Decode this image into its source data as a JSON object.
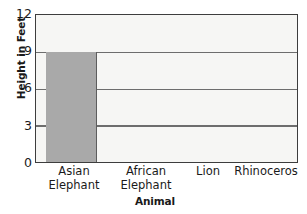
{
  "chart_data": {
    "type": "bar",
    "title": "",
    "xlabel": "Animal",
    "ylabel": "Height in Feet",
    "categories": [
      "Asian\nElephant",
      "African\nElephant",
      "Lion",
      "Rhinoceros"
    ],
    "values": [
      9,
      null,
      null,
      null
    ],
    "ylim": [
      0,
      12
    ],
    "yticks": [
      0,
      3,
      6,
      9,
      12
    ],
    "ytick_labels": [
      "0",
      "3",
      "6",
      "9",
      "12"
    ],
    "grid": "horizontal",
    "legend": "none",
    "bar_color": "#a9a9a9",
    "plot_background": "#f6f6f4",
    "frame_color": "#3d3d3d",
    "gridline_color": "#6d6d6d"
  }
}
